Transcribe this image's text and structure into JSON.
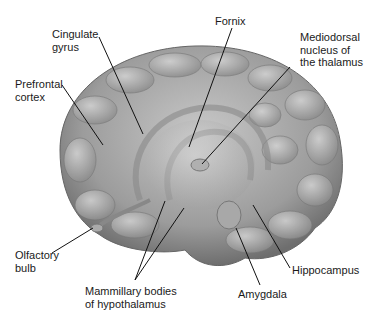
{
  "diagram": {
    "labels": [
      {
        "id": "cingulate",
        "text": "Cingulate\ngyrus",
        "x": 52,
        "y": 30
      },
      {
        "id": "prefrontal",
        "text": "Prefrontal\ncortex",
        "x": 15,
        "y": 80
      },
      {
        "id": "fornix",
        "text": "Fornix",
        "x": 215,
        "y": 17
      },
      {
        "id": "mediodorsal",
        "text": "Mediodorsal\nnucleus of\nthe thalamus",
        "x": 300,
        "y": 33
      },
      {
        "id": "olfactory",
        "text": "Olfactory\nbulb",
        "x": 15,
        "y": 251
      },
      {
        "id": "mammillary",
        "text": "Mammillary bodies\nof hypothalamus",
        "x": 85,
        "y": 286
      },
      {
        "id": "amygdala",
        "text": "Amygdala",
        "x": 238,
        "y": 289
      },
      {
        "id": "hippocampus",
        "text": "Hippocampus",
        "x": 292,
        "y": 266
      }
    ],
    "colors": {
      "background": "#ffffff",
      "text": "#1a1a1a",
      "line": "#111111",
      "brain": "#9a9a9a"
    }
  }
}
